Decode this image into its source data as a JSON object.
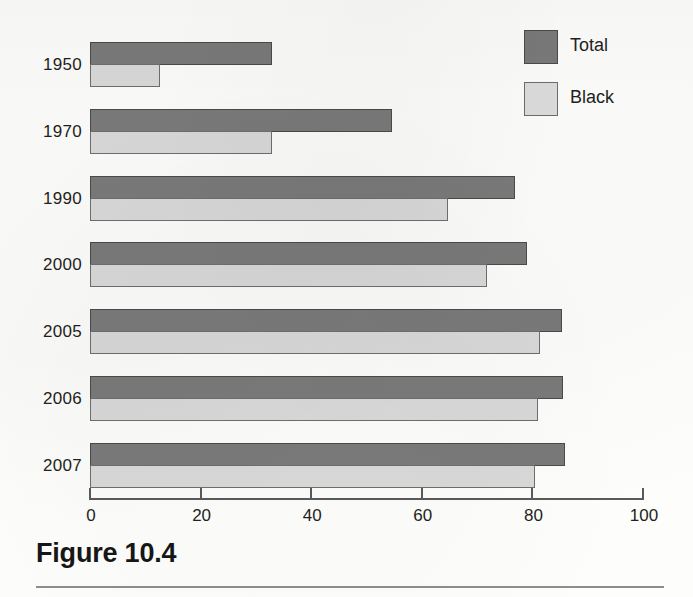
{
  "chart_data": {
    "type": "bar",
    "orientation": "horizontal",
    "title": "",
    "subtitle": "",
    "xlabel": "",
    "ylabel": "",
    "xlim": [
      0,
      100
    ],
    "xticks": [
      0,
      20,
      40,
      60,
      80,
      100
    ],
    "xtick_labels": [
      "0",
      "20",
      "40",
      "60",
      "80",
      "100"
    ],
    "grid": false,
    "legend_position": "top-right",
    "categories": [
      "1950",
      "1970",
      "1990",
      "2000",
      "2005",
      "2006",
      "2007"
    ],
    "series": [
      {
        "name": "Total",
        "color": "#7a7a7a",
        "values": [
          32.9,
          54.6,
          76.9,
          79.0,
          85.3,
          85.5,
          85.9
        ]
      },
      {
        "name": "Black",
        "color": "#d9d9d9",
        "values": [
          12.7,
          32.9,
          64.7,
          71.8,
          81.4,
          81.0,
          80.5
        ]
      }
    ]
  },
  "legend": {
    "entries": [
      {
        "label": "Total",
        "swatch": "total"
      },
      {
        "label": "Black",
        "swatch": "black"
      }
    ]
  },
  "caption": {
    "text": "Figure 10.4"
  }
}
